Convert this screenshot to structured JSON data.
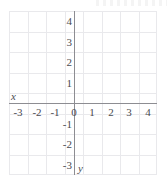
{
  "figure": {
    "kind": "cartesian-coordinate-grid",
    "background_color": "#ffffff",
    "grid_color": "#e9e9ec",
    "axis_color": "#8d8d92",
    "label_color": "#4a4a4f",
    "x_axis_label": "x",
    "y_axis_label": "y",
    "top_edge_artifact": ""
  },
  "chart_data": {
    "type": "scatter",
    "title": "",
    "subtitle": "",
    "xlabel": "x",
    "ylabel": "y",
    "xlim": [
      -3.5,
      4.5
    ],
    "xlim_gridline_range": [
      -3.5,
      4.5
    ],
    "ylim": [
      -3.5,
      4.5
    ],
    "grid": true,
    "legend": null,
    "legend_position": "none",
    "x_ticks": [
      -3,
      -2,
      -1,
      0,
      1,
      2,
      3,
      4
    ],
    "x_tick_labels": [
      "-3",
      "-2",
      "-1",
      "0",
      "1",
      "2",
      "3",
      "4"
    ],
    "y_ticks": [
      4,
      3,
      2,
      1,
      -1,
      -2,
      -3
    ],
    "y_tick_labels": [
      "4",
      "3",
      "2",
      "1",
      "-1",
      "-2",
      "-3"
    ],
    "origin_label": "0",
    "series": [],
    "annotations": [],
    "note": "Empty coordinate plane: no data points, lines, or shading are plotted."
  }
}
